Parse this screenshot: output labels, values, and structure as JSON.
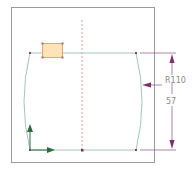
{
  "sketch": {
    "frame": {
      "x": 11,
      "y": 7,
      "width": 143,
      "height": 155,
      "stroke": "#9a9a9a"
    },
    "colors": {
      "geometry": "#9bbdb8",
      "centerline": "#c98a8a",
      "dimension": "#7a2f6e",
      "axis": "#2e6b3a",
      "selection_fill": "#fde3b5",
      "selection_stroke": "#e58a6a",
      "vertex": "#7a4a4a"
    },
    "dimensions": {
      "radius_label": "R110",
      "height_label": "57"
    },
    "axes": {
      "x_icon": "x-axis-arrow",
      "y_icon": "y-axis-arrow"
    }
  }
}
